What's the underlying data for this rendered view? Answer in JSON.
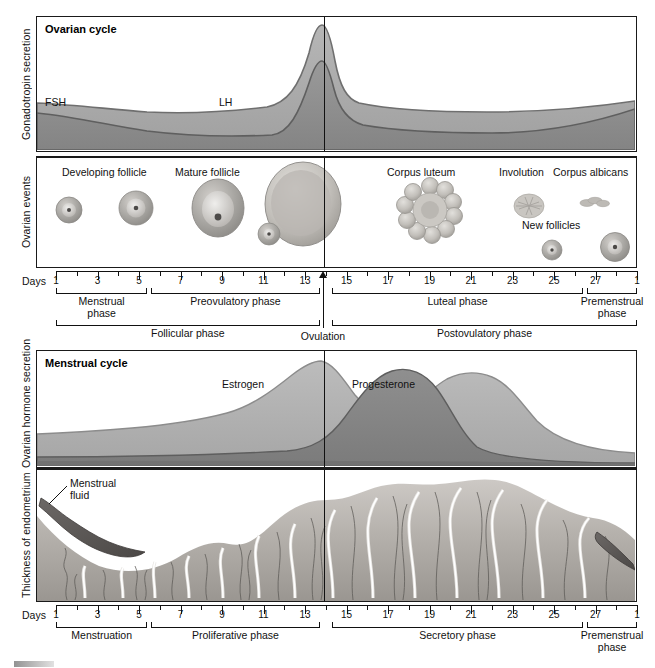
{
  "axes": {
    "gonadotropin": "Gonadotropin secretion",
    "ovarian_events": "Ovarian events",
    "hormone": "Ovarian hormone secretion",
    "endometrium": "Thickness of endometrium",
    "days_word_1": "Days",
    "days_word_2": "Days"
  },
  "panels": {
    "ovarian_cycle_title": "Ovarian cycle",
    "menstrual_cycle_title": "Menstrual cycle"
  },
  "curves": {
    "fsh": "FSH",
    "lh": "LH",
    "estrogen": "Estrogen",
    "progesterone": "Progesterone"
  },
  "ovarian_events": [
    {
      "label": "Developing follicle",
      "day": 3
    },
    {
      "label": "Mature follicle",
      "day": 9
    },
    {
      "label": "Corpus luteum",
      "day": 18
    },
    {
      "label": "Involution",
      "day": 23
    },
    {
      "label": "Corpus albicans",
      "day": 26
    },
    {
      "label": "New follicles",
      "day": 26
    }
  ],
  "endometrium_annotations": {
    "menstrual_fluid": "Menstrual\nfluid"
  },
  "ovulation": {
    "label": "Ovulation",
    "day": 14
  },
  "ruler_top": {
    "numbers": [
      "1",
      "3",
      "5",
      "7",
      "9",
      "11",
      "13",
      "15",
      "17",
      "19",
      "21",
      "23",
      "25",
      "27",
      "1"
    ],
    "days": [
      1,
      3,
      5,
      7,
      9,
      11,
      13,
      15,
      17,
      19,
      21,
      23,
      25,
      27,
      29
    ]
  },
  "ruler_bottom": {
    "numbers": [
      "1",
      "3",
      "5",
      "7",
      "9",
      "11",
      "13",
      "15",
      "17",
      "19",
      "21",
      "23",
      "25",
      "27",
      "1"
    ],
    "days": [
      1,
      3,
      5,
      7,
      9,
      11,
      13,
      15,
      17,
      19,
      21,
      23,
      25,
      27,
      29
    ]
  },
  "phases_top_row1": [
    {
      "label": "Menstrual\nphase",
      "start": 1,
      "end": 5.4
    },
    {
      "label": "Preovulatory phase",
      "start": 5.6,
      "end": 13.7
    },
    {
      "label": "Luteal phase",
      "start": 14.3,
      "end": 26.4
    },
    {
      "label": "Premenstrual\nphase",
      "start": 26.6,
      "end": 29
    }
  ],
  "phases_top_row2": [
    {
      "label": "Follicular phase",
      "start": 1,
      "end": 13.7
    },
    {
      "label": "Postovulatory phase",
      "start": 14.3,
      "end": 29
    }
  ],
  "phases_bottom": [
    {
      "label": "Menstruation",
      "start": 1,
      "end": 5.4
    },
    {
      "label": "Proliferative phase",
      "start": 5.6,
      "end": 13.7
    },
    {
      "label": "Secretory phase",
      "start": 14.3,
      "end": 26.4
    },
    {
      "label": "Premenstrual\nphase",
      "start": 26.6,
      "end": 29
    }
  ],
  "colors": {
    "fsh_fill": "#a9a9a9",
    "lh_fill": "#8f8f8f",
    "estrogen_fill": "#b4b4b4",
    "progesterone_fill": "#8a8a8a",
    "endometrium": "#b8b4b0",
    "menstrual_fluid": "#5d5a58",
    "stroke": "#1a1a1a"
  },
  "chart_data": {
    "type": "area",
    "xlabel": "Days",
    "x": [
      1,
      3,
      5,
      7,
      9,
      11,
      13,
      14,
      15,
      17,
      19,
      21,
      23,
      25,
      27,
      28
    ],
    "series": [
      {
        "name": "FSH",
        "panel": "Gonadotropin secretion",
        "values": [
          42,
          40,
          38,
          36,
          36,
          38,
          62,
          100,
          58,
          40,
          38,
          38,
          38,
          40,
          46,
          50
        ]
      },
      {
        "name": "LH",
        "panel": "Gonadotropin secretion",
        "values": [
          22,
          20,
          18,
          17,
          17,
          19,
          45,
          88,
          32,
          22,
          20,
          20,
          21,
          24,
          32,
          40
        ]
      },
      {
        "name": "Estrogen",
        "panel": "Ovarian hormone secretion",
        "values": [
          22,
          23,
          25,
          28,
          34,
          44,
          72,
          96,
          74,
          52,
          66,
          78,
          80,
          66,
          40,
          26
        ]
      },
      {
        "name": "Progesterone",
        "panel": "Ovarian hormone secretion",
        "values": [
          6,
          6,
          6,
          6,
          6,
          7,
          10,
          18,
          40,
          72,
          92,
          96,
          84,
          58,
          26,
          10
        ]
      },
      {
        "name": "Endometrial thickness",
        "panel": "Thickness of endometrium",
        "values": [
          60,
          40,
          18,
          22,
          30,
          38,
          48,
          52,
          60,
          70,
          80,
          88,
          90,
          86,
          70,
          58
        ]
      }
    ],
    "ylim": [
      0,
      100
    ],
    "grid": false,
    "legend": "inline-labels"
  }
}
